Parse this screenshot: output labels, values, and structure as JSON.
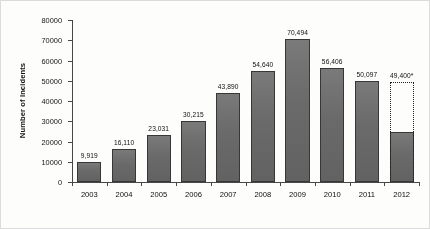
{
  "chart_data": {
    "type": "bar",
    "title": "",
    "xlabel": "",
    "ylabel": "Number of Incidents",
    "ylim": [
      0,
      80000
    ],
    "ytick_step": 10000,
    "yticks": [
      0,
      10000,
      20000,
      30000,
      40000,
      50000,
      60000,
      70000,
      80000
    ],
    "ytick_labels": [
      "0",
      "10000",
      "20000",
      "30000",
      "40000",
      "50000",
      "60000",
      "70000",
      "80000"
    ],
    "grid": false,
    "legend": null,
    "categories": [
      "2003",
      "2004",
      "2005",
      "2006",
      "2007",
      "2008",
      "2009",
      "2010",
      "2011",
      "2012"
    ],
    "values": [
      9919,
      16110,
      23031,
      30215,
      43890,
      54640,
      70494,
      56406,
      50097,
      24700
    ],
    "data_labels": [
      "9,919",
      "16,110",
      "23,031",
      "30,215",
      "43,890",
      "54,640",
      "70,494",
      "56,406",
      "50,097",
      "49,400*"
    ],
    "projection": {
      "category": "2012",
      "actual_value": 24700,
      "projected_value": 49400,
      "projected_label": "49,400*",
      "style": "dotted-outline"
    },
    "bar_color": "#6f6f6f",
    "bar_edge_color": "#3a3a3a",
    "axis_color": "#4a4a4a"
  }
}
